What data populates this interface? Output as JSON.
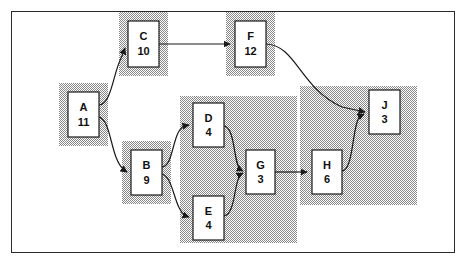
{
  "figure": {
    "frame": {
      "x": 11,
      "y": 11,
      "width": 444,
      "height": 242,
      "border_color": "#2b2b2b"
    },
    "background_color": "#ffffff",
    "node_fill_color": "#ffffff",
    "node_border_color": "#1a1a1a",
    "halo_color": "#b5b5b5",
    "edge_color": "#1a1a1a"
  },
  "nodes": [
    {
      "id": "A",
      "label": "A",
      "duration": "11",
      "x": 68,
      "y": 92,
      "width": 31,
      "height": 45
    },
    {
      "id": "C",
      "label": "C",
      "duration": "10",
      "x": 128,
      "y": 21,
      "width": 31,
      "height": 46
    },
    {
      "id": "F",
      "label": "F",
      "duration": "12",
      "x": 235,
      "y": 21,
      "width": 31,
      "height": 46
    },
    {
      "id": "B",
      "label": "B",
      "duration": "9",
      "x": 131,
      "y": 150,
      "width": 31,
      "height": 45
    },
    {
      "id": "D",
      "label": "D",
      "duration": "4",
      "x": 193,
      "y": 103,
      "width": 31,
      "height": 44
    },
    {
      "id": "E",
      "label": "E",
      "duration": "4",
      "x": 193,
      "y": 196,
      "width": 31,
      "height": 44
    },
    {
      "id": "G",
      "label": "G",
      "duration": "3",
      "x": 246,
      "y": 150,
      "width": 29,
      "height": 44
    },
    {
      "id": "H",
      "label": "H",
      "duration": "6",
      "x": 312,
      "y": 150,
      "width": 30,
      "height": 44
    },
    {
      "id": "J",
      "label": "J",
      "duration": "3",
      "x": 369,
      "y": 90,
      "width": 31,
      "height": 44
    }
  ],
  "halos": [
    {
      "id": "halo-a",
      "nodes": [
        "A"
      ],
      "x": 59,
      "y": 83,
      "width": 49,
      "height": 63
    },
    {
      "id": "halo-c",
      "nodes": [
        "C"
      ],
      "x": 119,
      "y": 12,
      "width": 49,
      "height": 64
    },
    {
      "id": "halo-f",
      "nodes": [
        "F"
      ],
      "x": 226,
      "y": 12,
      "width": 49,
      "height": 64
    },
    {
      "id": "halo-b",
      "nodes": [
        "B"
      ],
      "x": 122,
      "y": 141,
      "width": 49,
      "height": 63
    },
    {
      "id": "halo-deg",
      "nodes": [
        "D",
        "E",
        "G"
      ],
      "x": 180,
      "y": 96,
      "width": 117,
      "height": 147
    },
    {
      "id": "halo-hj",
      "nodes": [
        "H",
        "J"
      ],
      "x": 300,
      "y": 86,
      "width": 117,
      "height": 119
    }
  ],
  "edges": [
    {
      "id": "edge-a-c",
      "from": "A",
      "to": "C",
      "path": "M 99 105 C 112 104 113 72 122 56 L 125 48"
    },
    {
      "id": "edge-a-b",
      "from": "A",
      "to": "B",
      "path": "M 99 117 C 112 121 110 158 124 170 L 127 172"
    },
    {
      "id": "edge-c-f",
      "from": "C",
      "to": "F",
      "path": "M 159 44 L 230 44"
    },
    {
      "id": "edge-f-j",
      "from": "F",
      "to": "J",
      "path": "M 266 44 C 296 45 300 88 342 107 L 365 112"
    },
    {
      "id": "edge-b-d",
      "from": "B",
      "to": "D",
      "path": "M 162 167 C 174 166 172 132 184 126 L 189 125"
    },
    {
      "id": "edge-b-e",
      "from": "B",
      "to": "E",
      "path": "M 162 174 C 174 177 174 210 186 216 L 189 217"
    },
    {
      "id": "edge-d-g",
      "from": "D",
      "to": "G",
      "path": "M 224 126 C 236 128 233 165 241 170 L 243 171"
    },
    {
      "id": "edge-e-g",
      "from": "E",
      "to": "G",
      "path": "M 224 216 C 236 214 234 179 241 174 L 243 173"
    },
    {
      "id": "edge-g-h",
      "from": "G",
      "to": "H",
      "path": "M 275 172 L 307 172"
    },
    {
      "id": "edge-h-j",
      "from": "H",
      "to": "J",
      "path": "M 342 171 C 354 170 352 124 360 116 L 364 114"
    }
  ]
}
